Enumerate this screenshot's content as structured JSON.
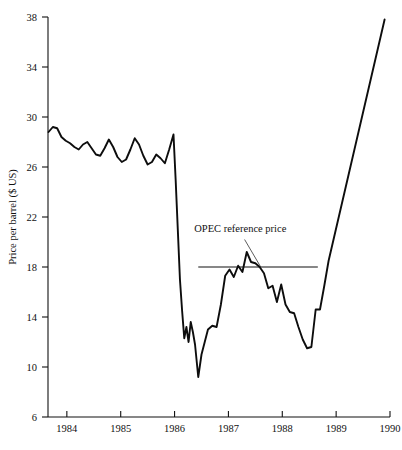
{
  "page": {
    "clipped_top_text": "",
    "clipped_bottom_text": ""
  },
  "chart_data": {
    "type": "line",
    "title": "",
    "subtitle": "",
    "xlabel": "",
    "ylabel": "Price per barrel ($ US)",
    "xlim": [
      1983.65,
      1990.0
    ],
    "ylim": [
      6,
      38
    ],
    "grid": false,
    "legend": "none",
    "x_ticks": [
      1984,
      1985,
      1986,
      1987,
      1988,
      1989,
      1990
    ],
    "x_tick_labels": [
      "1984",
      "1985",
      "1986",
      "1987",
      "1988",
      "1989",
      "1990"
    ],
    "y_ticks": [
      6,
      10,
      14,
      18,
      22,
      26,
      30,
      34,
      38
    ],
    "y_tick_labels": [
      "6",
      "10",
      "14",
      "18",
      "22",
      "26",
      "30",
      "34",
      "38"
    ],
    "series": [
      {
        "name": "Spot price per barrel",
        "color": "#0d0d0d",
        "x": [
          1983.66,
          1983.74,
          1983.82,
          1983.9,
          1983.98,
          1984.06,
          1984.14,
          1984.22,
          1984.3,
          1984.38,
          1984.46,
          1984.54,
          1984.62,
          1984.7,
          1984.78,
          1984.86,
          1984.94,
          1985.02,
          1985.1,
          1985.18,
          1985.26,
          1985.34,
          1985.42,
          1985.5,
          1985.58,
          1985.66,
          1985.74,
          1985.82,
          1985.9,
          1985.98,
          1986.02,
          1986.06,
          1986.1,
          1986.14,
          1986.18,
          1986.22,
          1986.26,
          1986.3,
          1986.34,
          1986.38,
          1986.44,
          1986.5,
          1986.56,
          1986.62,
          1986.7,
          1986.78,
          1986.86,
          1986.94,
          1987.02,
          1987.1,
          1987.18,
          1987.26,
          1987.34,
          1987.42,
          1987.5,
          1987.58,
          1987.66,
          1987.74,
          1987.82,
          1987.9,
          1987.98,
          1988.06,
          1988.14,
          1988.22,
          1988.3,
          1988.38,
          1988.46,
          1988.54,
          1988.62,
          1988.7,
          1988.78,
          1988.86,
          1989.9
        ],
        "y": [
          28.8,
          29.2,
          29.1,
          28.4,
          28.1,
          27.9,
          27.6,
          27.4,
          27.8,
          28.0,
          27.5,
          27.0,
          26.9,
          27.5,
          28.2,
          27.6,
          26.8,
          26.4,
          26.6,
          27.4,
          28.3,
          27.8,
          26.9,
          26.2,
          26.4,
          27.0,
          26.7,
          26.3,
          27.4,
          28.6,
          25.0,
          21.0,
          17.0,
          14.5,
          12.3,
          13.2,
          12.0,
          13.6,
          12.8,
          11.8,
          9.2,
          11.0,
          12.0,
          13.0,
          13.3,
          13.2,
          15.0,
          17.3,
          17.8,
          17.2,
          18.1,
          17.6,
          19.2,
          18.4,
          18.3,
          18.0,
          17.5,
          16.3,
          16.5,
          15.2,
          16.6,
          15.0,
          14.4,
          14.3,
          13.2,
          12.2,
          11.5,
          11.6,
          14.6,
          14.6,
          16.5,
          18.5,
          37.8
        ]
      }
    ],
    "annotations": [
      {
        "name": "opec-reference-price",
        "text": "OPEC reference price",
        "text_x": 1987.22,
        "text_y": 20.8,
        "leader_from_x": 1987.3,
        "leader_from_y": 20.2,
        "leader_to_x": 1987.6,
        "leader_to_y": 18.0,
        "ref_line": {
          "y": 18.0,
          "x_start": 1986.44,
          "x_end": 1988.66
        }
      }
    ]
  }
}
